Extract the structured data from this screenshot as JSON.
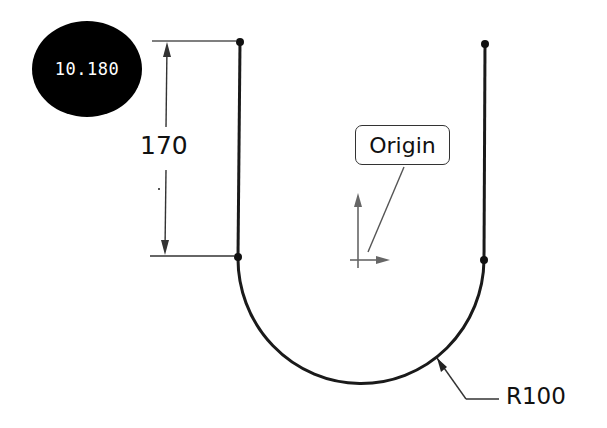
{
  "badge": {
    "value": "10.180"
  },
  "sketch": {
    "dimensions": [
      {
        "id": "height",
        "label": "170"
      },
      {
        "id": "radius",
        "label": "R100"
      }
    ],
    "origin_callout": {
      "label": "Origin"
    }
  },
  "colors": {
    "background": "#ffffff",
    "sketch_line": "#1a1a1a",
    "dimension_line": "#333333",
    "origin_axis": "#666666",
    "badge_fill": "#000000",
    "badge_text": "#ffffff"
  }
}
